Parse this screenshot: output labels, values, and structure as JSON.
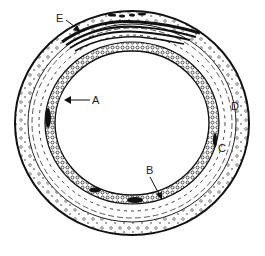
{
  "figure": {
    "type": "cross-section diagram",
    "labels": [
      {
        "id": "E",
        "text": "E",
        "pointer": "arrow",
        "target": "outer dark layered covering (top)"
      },
      {
        "id": "A",
        "text": "A",
        "pointer": "arrow",
        "target": "inner wall layer (left)"
      },
      {
        "id": "B",
        "text": "B",
        "pointer": "arrow",
        "target": "inner wall layer (bottom)"
      },
      {
        "id": "C",
        "text": "C",
        "pointer": "none",
        "target": "middle layer (right)"
      },
      {
        "id": "D",
        "text": "D",
        "pointer": "none",
        "target": "outer dotted layer (right)"
      }
    ],
    "colors": {
      "ink": "#1a1a1a",
      "background": "#ffffff"
    }
  },
  "caption": {
    "text": "",
    "note": "caption cut off at bottom edge; illegible"
  }
}
